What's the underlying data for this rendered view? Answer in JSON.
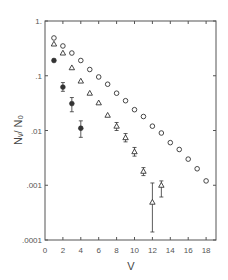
{
  "chart_data": {
    "type": "scatter",
    "title": "",
    "xlabel": "V",
    "ylabel": "N_V / N_0",
    "ylabel_display": "Nᵥ/ N₀",
    "xscale": "linear",
    "yscale": "log",
    "xlim": [
      0,
      19
    ],
    "ylim": [
      0.0001,
      1
    ],
    "grid": false,
    "legend": null,
    "x_ticks": [
      0,
      2,
      4,
      6,
      8,
      10,
      12,
      14,
      16,
      18
    ],
    "x_tick_labels": [
      "0",
      "2",
      "4",
      "6",
      "8",
      "10",
      "12",
      "14",
      "16",
      "18"
    ],
    "y_ticks": [
      1,
      0.1,
      0.01,
      0.001,
      0.0001
    ],
    "y_tick_labels": [
      "1.",
      ".1",
      ".01",
      ".001",
      ".0001"
    ],
    "series": [
      {
        "name": "open circles",
        "marker": "circle-open",
        "x": [
          1,
          2,
          3,
          4,
          5,
          6,
          7,
          8,
          9,
          10,
          11,
          12,
          13,
          14,
          15,
          16,
          17,
          18
        ],
        "y": [
          0.49,
          0.35,
          0.26,
          0.19,
          0.13,
          0.095,
          0.07,
          0.048,
          0.035,
          0.024,
          0.018,
          0.012,
          0.009,
          0.006,
          0.0045,
          0.003,
          0.002,
          0.0012
        ]
      },
      {
        "name": "open triangles",
        "marker": "triangle-open",
        "x": [
          1,
          2,
          3,
          4,
          5,
          6,
          7,
          8,
          9,
          10,
          11,
          12,
          13
        ],
        "y": [
          0.38,
          0.26,
          0.14,
          0.08,
          0.048,
          0.032,
          0.019,
          0.012,
          0.0074,
          0.0041,
          0.0018,
          0.00049,
          0.001
        ],
        "error_low": [
          null,
          null,
          null,
          null,
          null,
          null,
          null,
          0.01,
          0.0062,
          0.0034,
          0.0015,
          0.00014,
          0.00061
        ],
        "error_high": [
          null,
          null,
          null,
          null,
          null,
          null,
          null,
          0.014,
          0.0088,
          0.0049,
          0.0021,
          0.0011,
          0.0012
        ]
      },
      {
        "name": "solid circles",
        "marker": "circle-filled",
        "x": [
          1,
          2,
          3,
          4
        ],
        "y": [
          0.19,
          0.062,
          0.031,
          0.011
        ],
        "error_low": [
          null,
          0.052,
          0.022,
          0.0075
        ],
        "error_high": [
          null,
          0.075,
          0.04,
          0.015
        ]
      }
    ]
  },
  "colors": {
    "axis": "#555555",
    "marker": "#333333",
    "background": "#ffffff"
  }
}
